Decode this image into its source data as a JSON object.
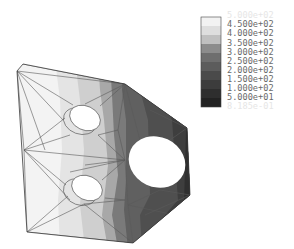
{
  "figure": {
    "type": "finite-element contour plot"
  },
  "legend": {
    "levels": [
      {
        "label": "5.000e+02",
        "color": "#ffffff",
        "faint": true
      },
      {
        "label": "4.500e+02",
        "color": "#f2f2f2"
      },
      {
        "label": "4.000e+02",
        "color": "#dedede"
      },
      {
        "label": "3.500e+02",
        "color": "#c0c0c0"
      },
      {
        "label": "3.000e+02",
        "color": "#8c8c8c"
      },
      {
        "label": "2.500e+02",
        "color": "#6e6e6e"
      },
      {
        "label": "2.000e+02",
        "color": "#5c5c5c"
      },
      {
        "label": "1.500e+02",
        "color": "#4a4a4a"
      },
      {
        "label": "1.000e+02",
        "color": "#3c3c3c"
      },
      {
        "label": "5.000e+01",
        "color": "#2e2e2e"
      },
      {
        "label": "8.185e-01",
        "color": "#222222",
        "faint": true
      }
    ]
  },
  "colors": {
    "background": "#ffffff",
    "mesh_line": "#5a5a5a",
    "hole_fill": "#ffffff"
  }
}
